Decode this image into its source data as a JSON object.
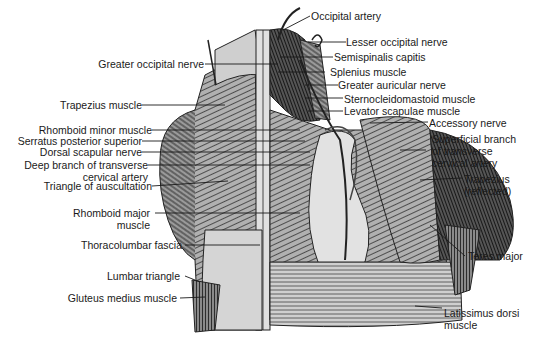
{
  "figure": {
    "colors": {
      "skin": "#c8c8c8",
      "muscle": "#7a7a7a",
      "dark": "#3a3a3a",
      "fascia": "#d9d9d9",
      "line": "#222222"
    }
  },
  "labels_left": [
    {
      "text": "Greater occipital nerve"
    },
    {
      "text": "Trapezius muscle"
    },
    {
      "text": "Rhomboid minor muscle"
    },
    {
      "text": "Serratus posterior superior"
    },
    {
      "text": "Dorsal scapular nerve"
    },
    {
      "text": "Deep branch of transverse",
      "text2": "cervical artery"
    },
    {
      "text": "Triangle of auscultation"
    },
    {
      "text": "Rhomboid major",
      "text2": "muscle"
    },
    {
      "text": "Thoracolumbar fascia"
    },
    {
      "text": "Lumbar triangle"
    },
    {
      "text": "Gluteus medius muscle"
    }
  ],
  "labels_right": [
    {
      "text": "Occipital artery"
    },
    {
      "text": "Lesser occipital nerve"
    },
    {
      "text": "Semispinalis capitis"
    },
    {
      "text": "Splenius muscle"
    },
    {
      "text": "Greater auricular nerve"
    },
    {
      "text": "Sternocleidomastoid muscle"
    },
    {
      "text": "Levator scapulae muscle"
    },
    {
      "text": "Accessory nerve"
    },
    {
      "text": "Superficial branch",
      "text2": "of transverse",
      "text3": "cervical artery"
    },
    {
      "text": "Trapezius",
      "text2": "(reflected)"
    },
    {
      "text": "Teres major"
    },
    {
      "text": "Latissimus dorsi",
      "text2": "muscle"
    }
  ]
}
